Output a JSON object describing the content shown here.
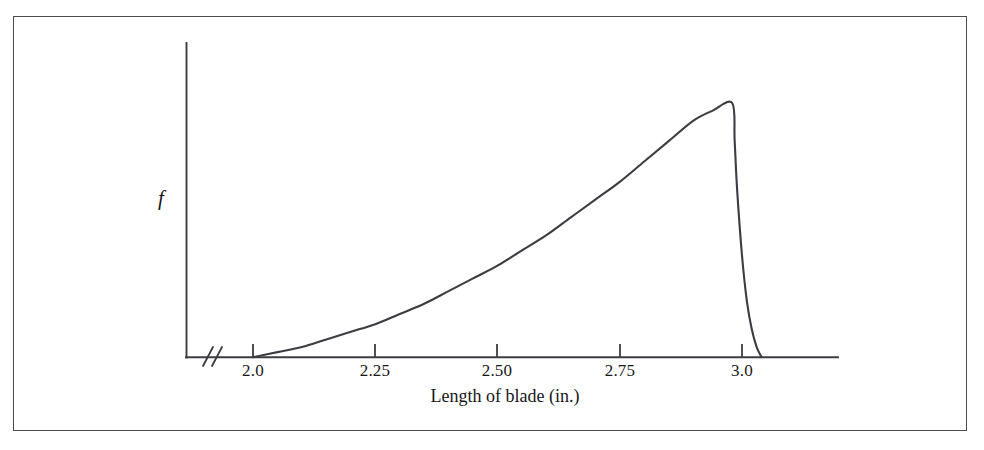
{
  "figure": {
    "frame_color": "#4a4a50",
    "background_color": "#ffffff",
    "ink_color": "#3c3c42"
  },
  "chart_data": {
    "type": "line",
    "title": "",
    "subtitle": "",
    "xlabel": "Length of blade (in.)",
    "ylabel": "f",
    "ylabel_style": "italic",
    "grid": false,
    "legend": null,
    "xlim": [
      1.97,
      3.12
    ],
    "ylim": [
      0,
      1.05
    ],
    "axis_break": {
      "present": true,
      "glyph": "//",
      "axis": "x",
      "position_note": "between origin and first tick 2.0"
    },
    "xticks": [
      2.0,
      2.25,
      2.5,
      2.75,
      3.0
    ],
    "xticklabels": [
      "2.0",
      "2.25",
      "2.50",
      "2.75",
      "3.0"
    ],
    "yticks": [],
    "yticklabels": [],
    "series": [
      {
        "name": "f",
        "description": "Probability density: rises convexly from zero at 2.0 to a maximum near 2.98, then falls almost vertically to zero just past 3.0",
        "x": [
          2.0,
          2.05,
          2.1,
          2.15,
          2.2,
          2.25,
          2.3,
          2.35,
          2.4,
          2.45,
          2.5,
          2.55,
          2.6,
          2.65,
          2.7,
          2.75,
          2.8,
          2.85,
          2.9,
          2.94,
          2.98,
          2.985,
          2.99,
          3.0,
          3.01,
          3.02,
          3.03,
          3.04
        ],
        "y": [
          0.0,
          0.02,
          0.04,
          0.07,
          0.1,
          0.13,
          0.17,
          0.21,
          0.26,
          0.31,
          0.36,
          0.42,
          0.48,
          0.55,
          0.62,
          0.69,
          0.77,
          0.85,
          0.93,
          0.97,
          1.0,
          0.85,
          0.66,
          0.4,
          0.22,
          0.11,
          0.04,
          0.0
        ]
      }
    ],
    "annotations": []
  },
  "labels": {
    "y_axis": "f",
    "x_axis": "Length of blade (in.)",
    "tick_2_0": "2.0",
    "tick_2_25": "2.25",
    "tick_2_50": "2.50",
    "tick_2_75": "2.75",
    "tick_3_0": "3.0"
  }
}
